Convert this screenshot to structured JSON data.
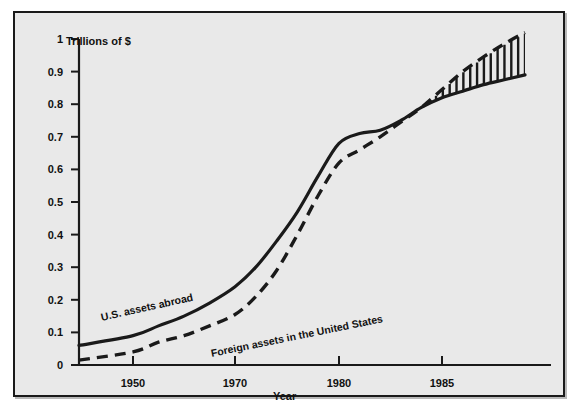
{
  "chart_data": {
    "type": "line",
    "title": "",
    "xlabel": "Year",
    "ylabel": "Trillions of $",
    "ylim": [
      0,
      1
    ],
    "grid": false,
    "legend_position": "inline-annotations",
    "y_ticks": [
      "0",
      "0.1",
      "0.2",
      "0.3",
      "0.4",
      "0.5",
      "0.6",
      "0.7",
      "0.8",
      "0.9",
      "1"
    ],
    "y_tick_values": [
      0,
      0.1,
      0.2,
      0.3,
      0.4,
      0.5,
      0.6,
      0.7,
      0.8,
      0.9,
      1.0
    ],
    "x_ticks": [
      "1950",
      "1970",
      "1980",
      "1985"
    ],
    "x_tick_values": [
      1950,
      1970,
      1980,
      1985
    ],
    "x_axis_note": "Non-uniform (compressed) time axis: equal pixel spacing between 1950-1970, 1970-1980 and 1980-1985",
    "series": [
      {
        "name": "U.S. assets abroad",
        "style": "solid",
        "color": "#1a1a1a",
        "x": [
          1946,
          1950,
          1955,
          1960,
          1965,
          1970,
          1972,
          1974,
          1976,
          1978,
          1980,
          1981,
          1982,
          1983,
          1984,
          1985,
          1986,
          1987,
          1988,
          1989
        ],
        "values": [
          0.06,
          0.09,
          0.12,
          0.15,
          0.19,
          0.24,
          0.3,
          0.38,
          0.47,
          0.58,
          0.68,
          0.71,
          0.72,
          0.75,
          0.79,
          0.82,
          0.84,
          0.86,
          0.875,
          0.89
        ]
      },
      {
        "name": "Foreign assets in the United States",
        "style": "dashed",
        "color": "#1a1a1a",
        "x": [
          1946,
          1950,
          1955,
          1960,
          1965,
          1970,
          1972,
          1974,
          1976,
          1978,
          1980,
          1981,
          1982,
          1983,
          1984,
          1985,
          1986,
          1987,
          1988,
          1989
        ],
        "values": [
          0.015,
          0.04,
          0.07,
          0.09,
          0.12,
          0.155,
          0.21,
          0.29,
          0.4,
          0.52,
          0.62,
          0.66,
          0.7,
          0.745,
          0.79,
          0.845,
          0.9,
          0.945,
          0.985,
          1.02
        ]
      }
    ],
    "annotations": [
      {
        "name": "U.S. assets abroad",
        "type": "series-label"
      },
      {
        "name": "Foreign assets in the United States",
        "type": "series-label"
      },
      {
        "name": "net-debtor-gap",
        "type": "hatched-region",
        "description": "Vertical bar hatching between the two curves from the crossover point (~1984) to the right edge, where foreign assets in the U.S. exceed U.S. assets abroad",
        "start_x": 1984,
        "end_x": 1989
      }
    ]
  },
  "axes": {
    "y_title": "Trillions of $",
    "x_title": "Year"
  },
  "labels": {
    "series_us": "U.S. assets abroad",
    "series_foreign": "Foreign assets in the United States"
  },
  "colors": {
    "panel_background": "#e9e9e9",
    "page_background": "#ffffff",
    "ink": "#1a1a1a",
    "frame": "#1a1a1a"
  }
}
